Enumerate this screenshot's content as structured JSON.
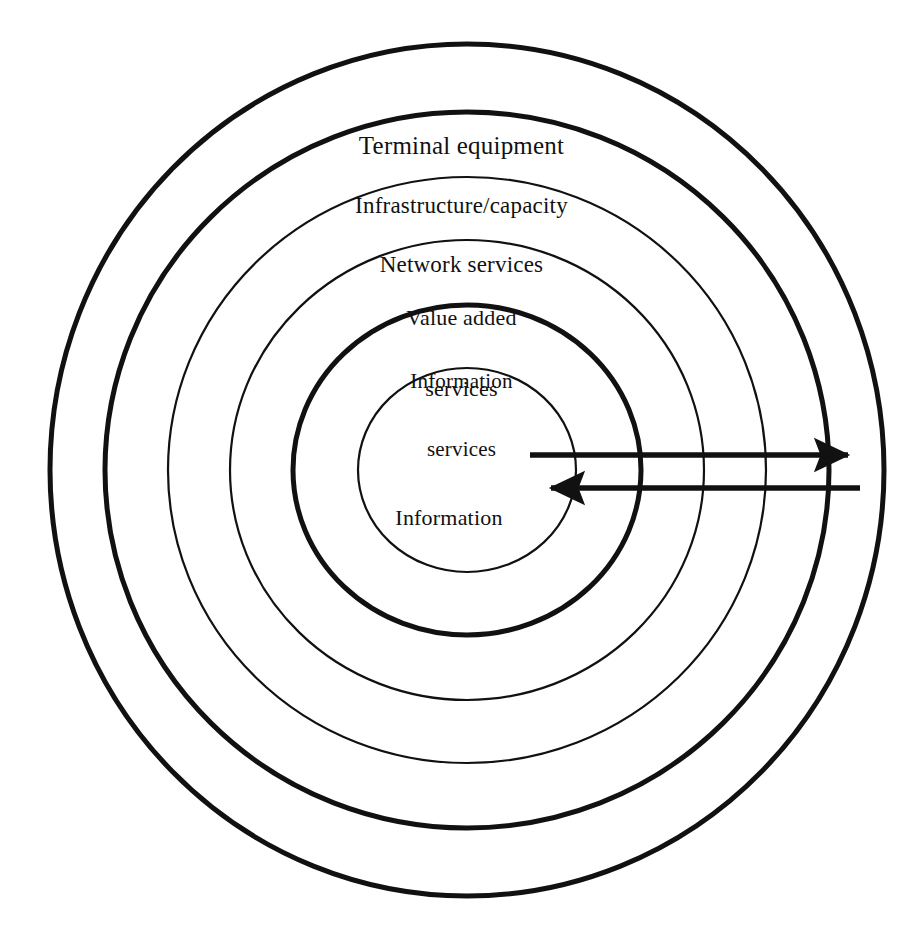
{
  "diagram": {
    "type": "concentric-rings",
    "background_color": "#ffffff",
    "stroke_color": "#111111",
    "canvas": {
      "width": 923,
      "height": 930
    },
    "center": {
      "x": 467,
      "y": 470
    },
    "rings": [
      {
        "id": "terminal-equipment",
        "label": "Terminal equipment",
        "label_lines": [
          "Terminal equipment"
        ],
        "level": 1,
        "rx": 417,
        "ry": 426,
        "stroke_width": 5,
        "weight": "thick",
        "label_x": 467,
        "label_y": 78,
        "font_size": 25
      },
      {
        "id": "infrastructure-capacity",
        "label": "Infrastructure/capacity",
        "label_lines": [
          "Infrastructure/capacity"
        ],
        "level": 2,
        "rx": 362,
        "ry": 358,
        "stroke_width": 5,
        "weight": "thick",
        "label_x": 467,
        "label_y": 144,
        "font_size": 23
      },
      {
        "id": "network-services",
        "label": "Network services",
        "label_lines": [
          "Network services"
        ],
        "level": 3,
        "rx": 299,
        "ry": 293,
        "stroke_width": 2,
        "weight": "thin",
        "label_x": 467,
        "label_y": 203,
        "font_size": 23
      },
      {
        "id": "value-added-services",
        "label": "Value added services",
        "label_lines": [
          "Value added",
          "services"
        ],
        "level": 4,
        "rx": 237,
        "ry": 230,
        "stroke_width": 2,
        "weight": "thin",
        "label_x": 467,
        "label_y": 258,
        "font_size": 22
      },
      {
        "id": "information-services",
        "label": "Information services",
        "label_lines": [
          "Information",
          "services"
        ],
        "level": 5,
        "rx": 174,
        "ry": 165,
        "stroke_width": 5,
        "weight": "thick",
        "label_x": 467,
        "label_y": 325,
        "font_size": 21
      },
      {
        "id": "information",
        "label": "Information",
        "label_lines": [
          "Information"
        ],
        "level": 6,
        "rx": 109,
        "ry": 102,
        "stroke_width": 2,
        "weight": "thin",
        "label_x": 455,
        "label_y": 458,
        "font_size": 22
      }
    ],
    "arrows": [
      {
        "id": "outbound-arrow",
        "direction": "right",
        "description": "Information flowing outward from the core to the outside",
        "x_start": 530,
        "x_end": 866,
        "y": 455,
        "stroke_width": 5
      },
      {
        "id": "inbound-arrow",
        "direction": "left",
        "description": "Information flowing inward from the outside to the core",
        "x_start": 860,
        "x_end": 533,
        "y": 488,
        "stroke_width": 5
      }
    ]
  }
}
